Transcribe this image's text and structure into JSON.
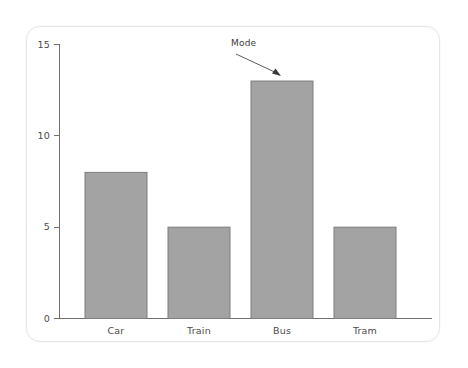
{
  "chart_data": {
    "type": "bar",
    "title": "",
    "subtitle": "",
    "xlabel": "",
    "ylabel": "",
    "categories": [
      "Car",
      "Train",
      "Bus",
      "Tram"
    ],
    "values": [
      8,
      5,
      13,
      5
    ],
    "series": [
      {
        "name": "Count",
        "values": [
          8,
          5,
          13,
          5
        ]
      }
    ],
    "ylim": [
      0,
      15
    ],
    "yticks": [
      0,
      5,
      10,
      15
    ],
    "ytick_labels": [
      "0",
      "5",
      "10",
      "15"
    ],
    "xtick_labels": [
      "Car",
      "Train",
      "Bus",
      "Tram"
    ],
    "grid": false,
    "legend": false,
    "legend_position": "none",
    "annotations": [
      {
        "text": "Mode",
        "points_to_category": "Bus",
        "points_to_value": 13
      }
    ],
    "colors": {
      "bar_fill": "#a3a3a3",
      "bar_stroke": "#7d7d7d",
      "axis": "#6f6f6f",
      "text": "#4b4b4b",
      "annotation": "#3b3b3b",
      "card_background": "#ffffff",
      "page_background": "#ffffff"
    }
  },
  "axis": {
    "y_ticks": [
      {
        "label": "15",
        "value": 15
      },
      {
        "label": "10",
        "value": 10
      },
      {
        "label": "5",
        "value": 5
      },
      {
        "label": "0",
        "value": 0
      }
    ],
    "x_ticks": [
      {
        "label": "Car"
      },
      {
        "label": "Train"
      },
      {
        "label": "Bus"
      },
      {
        "label": "Tram"
      }
    ]
  },
  "annotation": {
    "label": "Mode"
  }
}
